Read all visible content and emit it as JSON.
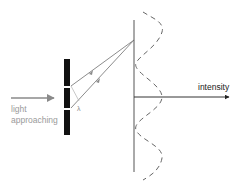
{
  "diagram": {
    "labels": {
      "incoming_light": [
        "light",
        "approaching"
      ],
      "intensity_axis": "intensity",
      "path_difference": "λ"
    },
    "colors": {
      "barrier": "#111111",
      "beam": "#888888",
      "incoming_arrow": "#8a8a8a",
      "incoming_text": "#9a9a9a",
      "screen_line": "#555555",
      "axis": "#333333",
      "intensity_curve": "#666666",
      "axis_text": "#222222"
    },
    "elements": {
      "barrier": "double-slit barrier with two slits",
      "screen": "vertical detection screen",
      "intensity_curve": "dashed cosine-like intensity pattern with 3 maxima and 2 minima"
    }
  }
}
